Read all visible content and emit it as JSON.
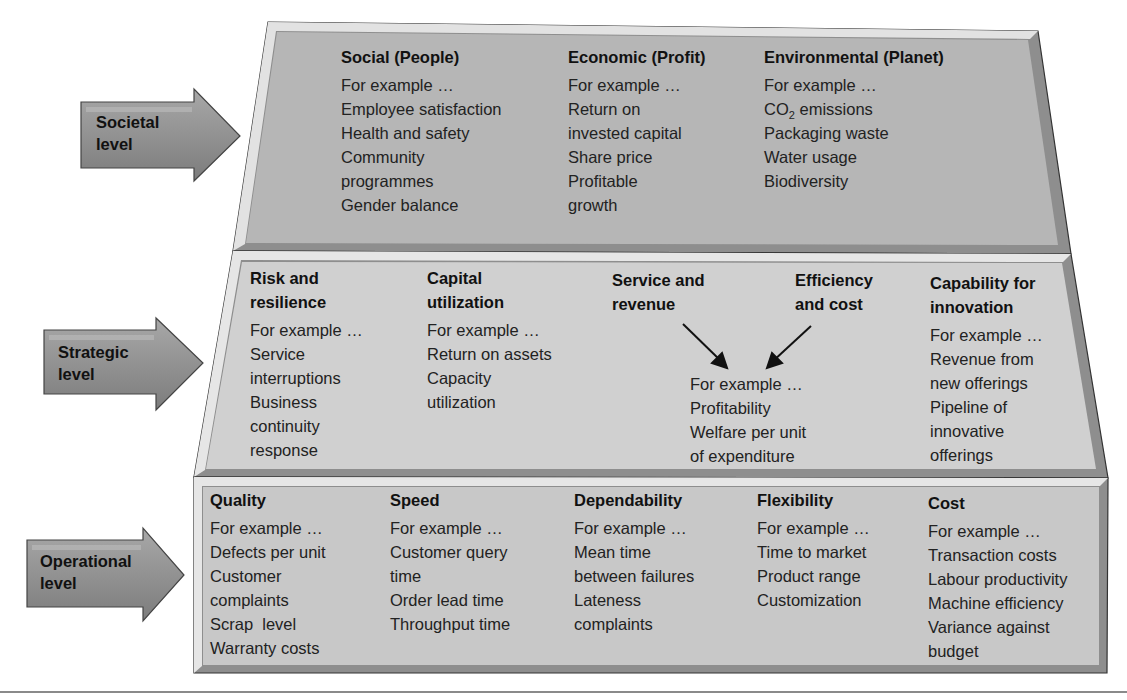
{
  "levels": {
    "societal": {
      "label": "Societal\nlevel",
      "columns": [
        {
          "heading": "Social (People)",
          "intro": "For example …",
          "items": [
            "Employee satisfaction",
            "Health and safety",
            "Community",
            "programmes",
            "Gender balance"
          ]
        },
        {
          "heading": "Economic (Profit)",
          "intro": "For example …",
          "items": [
            "Return on",
            "invested capital",
            "Share price",
            "Profitable",
            "growth"
          ]
        },
        {
          "heading": "Environmental (Planet)",
          "intro": "For example …",
          "items": [
            "CO2 emissions",
            "Packaging waste",
            "Water usage",
            "Biodiversity"
          ]
        }
      ]
    },
    "strategic": {
      "label": "Strategic\nlevel",
      "columns": [
        {
          "heading": "Risk and\nresilience",
          "intro": "For example …",
          "items": [
            "Service",
            "interruptions",
            "Business",
            "continuity",
            "response"
          ]
        },
        {
          "heading": "Capital\nutilization",
          "intro": "For example …",
          "items": [
            "Return on assets",
            "Capacity",
            "utilization"
          ]
        },
        {
          "heading": "Capability for\ninnovation",
          "intro": "For example …",
          "items": [
            "Revenue from",
            "new offerings",
            "Pipeline of",
            "innovative",
            "offerings"
          ]
        }
      ],
      "combined": {
        "heading_left": "Service and\nrevenue",
        "heading_right": "Efficiency\nand cost",
        "intro": "For example …",
        "items": [
          "Profitability",
          "Welfare per unit",
          "of expenditure"
        ]
      }
    },
    "operational": {
      "label": "Operational\nlevel",
      "columns": [
        {
          "heading": "Quality",
          "intro": "For example …",
          "items": [
            "Defects per unit",
            "Customer",
            "complaints",
            "Scrap  level",
            "Warranty costs"
          ]
        },
        {
          "heading": "Speed",
          "intro": "For example …",
          "items": [
            "Customer query",
            "time",
            "Order lead time",
            "Throughput time"
          ]
        },
        {
          "heading": "Dependability",
          "intro": "For example …",
          "items": [
            "Mean time",
            "between failures",
            "Lateness",
            "complaints"
          ]
        },
        {
          "heading": "Flexibility",
          "intro": "For example …",
          "items": [
            "Time to market",
            "Product range",
            "Customization"
          ]
        },
        {
          "heading": "Cost",
          "intro": "For example …",
          "items": [
            "Transaction costs",
            "Labour productivity",
            "Machine efficiency",
            "Variance against",
            "budget"
          ]
        }
      ]
    }
  },
  "colors": {
    "societal_fill": "#b5b5b5",
    "strategic_fill": "#cfcfcf",
    "operational_fill": "#c6c6c6",
    "bevel_light": "#e6e6e6",
    "bevel_dark": "#8e8e8e",
    "arrow_fill": "#8f8f8f",
    "outline": "#333333"
  }
}
